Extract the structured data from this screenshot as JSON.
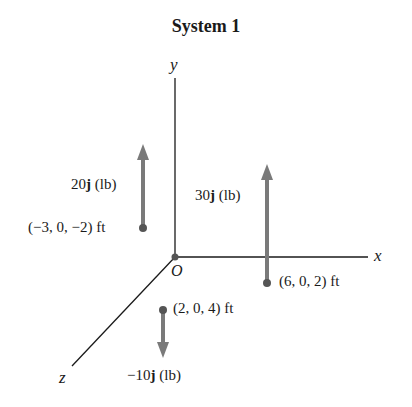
{
  "title": "System 1",
  "axes": {
    "x_label": "x",
    "y_label": "y",
    "z_label": "z",
    "origin_label": "O"
  },
  "colors": {
    "axis": "#1a1a1a",
    "arrow": "#7a7a7a",
    "point": "#555555"
  },
  "forces": [
    {
      "magnitude_prefix": "20",
      "unit_vector": "j",
      "unit": " (lb)",
      "position": "(−3, 0, −2) ft",
      "direction": "up"
    },
    {
      "magnitude_prefix": "30",
      "unit_vector": "j",
      "unit": " (lb)",
      "position": "(6, 0, 2) ft",
      "direction": "up"
    },
    {
      "magnitude_prefix": "−10",
      "unit_vector": "j",
      "unit": " (lb)",
      "position": "(2, 0, 4) ft",
      "direction": "down"
    }
  ]
}
